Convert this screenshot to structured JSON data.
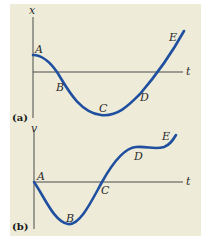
{
  "figure": {
    "background_color": "#eeecd9",
    "curve_color": "#1f4f9e",
    "axis_color": "#4a4a4a",
    "panels": [
      {
        "id": "a",
        "panel_label": "(a)",
        "y_axis_label": "x",
        "x_axis_label": "t",
        "points": [
          "A",
          "B",
          "C",
          "D",
          "E"
        ]
      },
      {
        "id": "b",
        "panel_label": "(b)",
        "y_axis_label": "v",
        "x_axis_label": "t",
        "points": [
          "A",
          "B",
          "C",
          "D",
          "E"
        ]
      }
    ]
  }
}
